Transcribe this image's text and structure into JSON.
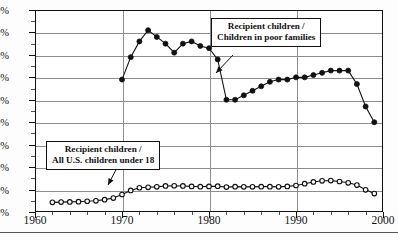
{
  "chart_data": {
    "type": "line",
    "title": "",
    "xlabel": "",
    "ylabel": "",
    "xlim": [
      1960,
      2000
    ],
    "ylim": [
      0,
      90
    ],
    "grid": true,
    "legend_position": "annotations-inline",
    "y_tick_labels": [
      "0%",
      "10%",
      "20%",
      "30%",
      "40%",
      "50%",
      "60%",
      "70%",
      "80%",
      "90%"
    ],
    "y_tick_values": [
      0,
      10,
      20,
      30,
      40,
      50,
      60,
      70,
      80,
      90
    ],
    "x_tick_labels": [
      "1960",
      "1970",
      "1980",
      "1990",
      "2000"
    ],
    "x_tick_values": [
      1960,
      1970,
      1980,
      1990,
      2000
    ],
    "annotations": [
      {
        "id": "poor-families",
        "line1": "Recipient children  /",
        "line2": "Children in poor families",
        "points_to_series": "Recipient children / Children in poor families"
      },
      {
        "id": "all-children",
        "line1": "Recipient children /",
        "line2": "All U.S. children under 18",
        "points_to_series": "Recipient children / All U.S. children under 18"
      }
    ],
    "series": [
      {
        "name": "Recipient children / Children in poor families",
        "marker": "filled-circle",
        "x": [
          1970,
          1971,
          1972,
          1973,
          1974,
          1975,
          1976,
          1977,
          1978,
          1979,
          1980,
          1981,
          1982,
          1983,
          1984,
          1985,
          1986,
          1987,
          1988,
          1989,
          1990,
          1991,
          1992,
          1993,
          1994,
          1995,
          1996,
          1997,
          1998,
          1999
        ],
        "values": [
          59,
          69,
          76,
          81,
          78,
          75,
          71,
          75,
          76,
          74,
          73,
          68,
          50,
          50,
          52,
          54,
          56,
          58,
          59,
          59,
          60,
          60,
          61,
          62,
          63,
          63,
          63,
          57,
          47,
          40
        ]
      },
      {
        "name": "Recipient children / All U.S. children under 18",
        "marker": "open-circle",
        "x": [
          1962,
          1963,
          1964,
          1965,
          1966,
          1967,
          1968,
          1969,
          1970,
          1971,
          1972,
          1973,
          1974,
          1975,
          1976,
          1977,
          1978,
          1979,
          1980,
          1981,
          1982,
          1983,
          1984,
          1985,
          1986,
          1987,
          1988,
          1989,
          1990,
          1991,
          1992,
          1993,
          1994,
          1995,
          1996,
          1997,
          1998,
          1999
        ],
        "values": [
          4.3,
          4.4,
          4.5,
          4.6,
          4.8,
          5.0,
          5.5,
          6.2,
          7.8,
          9.6,
          10.8,
          11.0,
          11.2,
          11.6,
          11.7,
          11.6,
          11.4,
          11.3,
          11.4,
          11.5,
          11.1,
          11.3,
          11.2,
          11.2,
          11.3,
          11.3,
          11.2,
          11.4,
          11.8,
          12.6,
          13.4,
          13.9,
          14.0,
          13.6,
          13.0,
          12.0,
          9.9,
          8.2
        ]
      }
    ]
  }
}
